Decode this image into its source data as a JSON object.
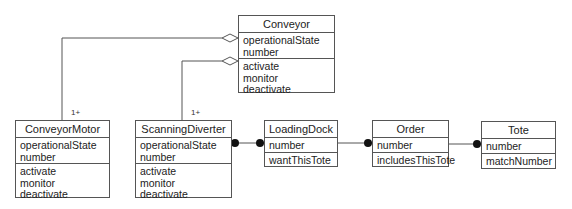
{
  "classes": {
    "conveyor": {
      "name": "Conveyor",
      "attributes": [
        "operationalState",
        "number"
      ],
      "operations": [
        "activate",
        "monitor",
        "deactivate"
      ]
    },
    "conveyor_motor": {
      "name": "ConveyorMotor",
      "attributes": [
        "operationalState",
        "number"
      ],
      "operations": [
        "activate",
        "monitor",
        "deactivate"
      ]
    },
    "scanning_diverter": {
      "name": "ScanningDiverter",
      "attributes": [
        "operationalState",
        "number"
      ],
      "operations": [
        "activate",
        "monitor",
        "deactivate"
      ]
    },
    "loading_dock": {
      "name": "LoadingDock",
      "attributes": [
        "number"
      ],
      "operations": [
        "wantThisTote"
      ]
    },
    "order": {
      "name": "Order",
      "attributes": [
        "number"
      ],
      "operations": [
        "includesThisTote"
      ]
    },
    "tote": {
      "name": "Tote",
      "attributes": [
        "number"
      ],
      "operations": [
        "matchNumber"
      ]
    }
  },
  "relationships": [
    {
      "type": "aggregation",
      "whole": "Conveyor",
      "part": "ConveyorMotor",
      "multiplicity": "1+"
    },
    {
      "type": "aggregation",
      "whole": "Conveyor",
      "part": "ScanningDiverter",
      "multiplicity": "1+"
    },
    {
      "type": "association",
      "from": "ScanningDiverter",
      "to": "LoadingDock",
      "ends": "filled-dot both"
    },
    {
      "type": "association",
      "from": "LoadingDock",
      "to": "Order",
      "ends": "filled-dot at Order"
    },
    {
      "type": "association",
      "from": "Order",
      "to": "Tote",
      "ends": "filled-dot at Tote"
    }
  ],
  "multiplicities": {
    "motor": "1+",
    "diverter": "1+"
  },
  "colors": {
    "line": "#555555",
    "background": "#ffffff",
    "text": "#222222"
  }
}
